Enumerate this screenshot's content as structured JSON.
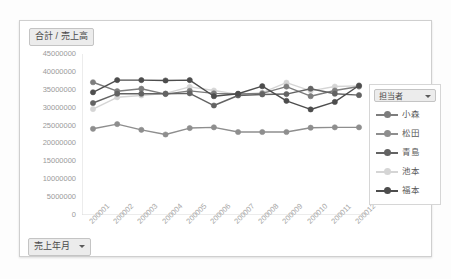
{
  "chart": {
    "value_field_label": "合計 / 売上高",
    "row_field_label": "売上年月",
    "row_field_caret_icon": "chevron-down-icon"
  },
  "legend": {
    "header_label": "担当者",
    "header_caret_icon": "chevron-down-icon",
    "items": [
      {
        "label": "小森",
        "color": "#7d7d7d"
      },
      {
        "label": "松田",
        "color": "#8e8e8e"
      },
      {
        "label": "青島",
        "color": "#636363"
      },
      {
        "label": "池本",
        "color": "#d5d5d5"
      },
      {
        "label": "福本",
        "color": "#4d4d4d"
      }
    ]
  },
  "chart_data": {
    "type": "line",
    "title": "合計 / 売上高",
    "xlabel": "売上年月",
    "ylabel": "合計 / 売上高",
    "grid": false,
    "legend_position": "right",
    "ylim": [
      0,
      45000000
    ],
    "ytick_step": 5000000,
    "yticks": [
      "45000000",
      "40000000",
      "35000000",
      "30000000",
      "25000000",
      "20000000",
      "15000000",
      "10000000",
      "5000000",
      "0"
    ],
    "categories": [
      "200001",
      "200002",
      "200003",
      "200004",
      "200005",
      "200006",
      "200007",
      "200008",
      "200009",
      "200010",
      "200011",
      "200012"
    ],
    "series": [
      {
        "name": "小森",
        "color": "#7d7d7d",
        "values": [
          37100000,
          34600000,
          35300000,
          33800000,
          34700000,
          34000000,
          33800000,
          34000000,
          35900000,
          33200000,
          34800000,
          35900000
        ]
      },
      {
        "name": "松田",
        "color": "#8e8e8e",
        "values": [
          24100000,
          25400000,
          23800000,
          22500000,
          24300000,
          24500000,
          23200000,
          23200000,
          23200000,
          24400000,
          24500000,
          24500000
        ]
      },
      {
        "name": "青島",
        "color": "#636363",
        "values": [
          31300000,
          33900000,
          33900000,
          33900000,
          34000000,
          30600000,
          33400000,
          33700000,
          33800000,
          35300000,
          33900000,
          33500000
        ]
      },
      {
        "name": "池本",
        "color": "#d5d5d5",
        "values": [
          29600000,
          32900000,
          33400000,
          34000000,
          35800000,
          34800000,
          33700000,
          34200000,
          37000000,
          34700000,
          35900000,
          36100000
        ]
      },
      {
        "name": "福本",
        "color": "#4d4d4d",
        "values": [
          34300000,
          37700000,
          37700000,
          37600000,
          37700000,
          33200000,
          33900000,
          36000000,
          31900000,
          29500000,
          31600000,
          36200000
        ]
      }
    ]
  }
}
